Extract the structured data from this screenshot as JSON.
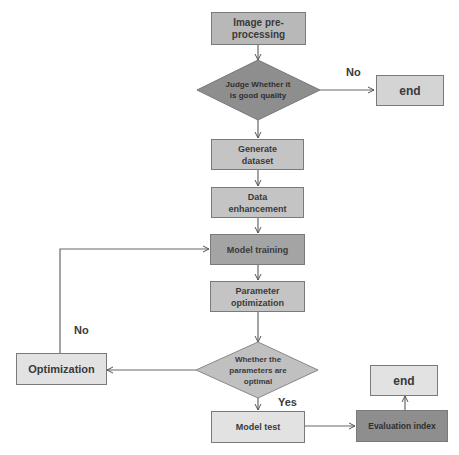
{
  "diagram": {
    "type": "flowchart",
    "nodes": {
      "image_preprocessing": {
        "label": "Image pre-processing",
        "shape": "rectangle",
        "fill": "#b8b8b8"
      },
      "judge_quality": {
        "label": "Judge Whether it is good quality",
        "shape": "diamond",
        "fill": "#8e8e8e"
      },
      "end_top": {
        "label": "end",
        "shape": "rectangle",
        "fill": "#d4d4d4"
      },
      "generate_dataset": {
        "label": "Generate dataset",
        "shape": "rectangle",
        "fill": "#c4c4c4"
      },
      "data_enhancement": {
        "label": "Data enhancement",
        "shape": "rectangle",
        "fill": "#c4c4c4"
      },
      "model_training": {
        "label": "Model training",
        "shape": "rectangle",
        "fill": "#a4a4a4"
      },
      "parameter_optimization": {
        "label": "Parameter optimization",
        "shape": "rectangle",
        "fill": "#c4c4c4"
      },
      "parameters_optimal": {
        "label": "Whether the parameters are optimal",
        "shape": "diamond",
        "fill": "#c0c0c0"
      },
      "optimization": {
        "label": "Optimization",
        "shape": "rectangle",
        "fill": "#e2e2e2"
      },
      "model_test": {
        "label": "Model test",
        "shape": "rectangle",
        "fill": "#e2e2e2"
      },
      "evaluation_index": {
        "label": "Evaluation index",
        "shape": "rectangle",
        "fill": "#8e8e8e"
      },
      "end_bottom": {
        "label": "end",
        "shape": "rectangle",
        "fill": "#e2e2e2"
      }
    },
    "edge_labels": {
      "quality_no": "No",
      "optimal_no": "No",
      "optimal_yes": "Yes"
    },
    "edges": [
      {
        "from": "image_preprocessing",
        "to": "judge_quality"
      },
      {
        "from": "judge_quality",
        "to": "end_top",
        "label": "No"
      },
      {
        "from": "judge_quality",
        "to": "generate_dataset"
      },
      {
        "from": "generate_dataset",
        "to": "data_enhancement"
      },
      {
        "from": "data_enhancement",
        "to": "model_training"
      },
      {
        "from": "model_training",
        "to": "parameter_optimization"
      },
      {
        "from": "parameter_optimization",
        "to": "parameters_optimal"
      },
      {
        "from": "parameters_optimal",
        "to": "optimization",
        "label": "No"
      },
      {
        "from": "optimization",
        "to": "model_training"
      },
      {
        "from": "parameters_optimal",
        "to": "model_test",
        "label": "Yes"
      },
      {
        "from": "model_test",
        "to": "evaluation_index"
      },
      {
        "from": "evaluation_index",
        "to": "end_bottom"
      }
    ]
  }
}
